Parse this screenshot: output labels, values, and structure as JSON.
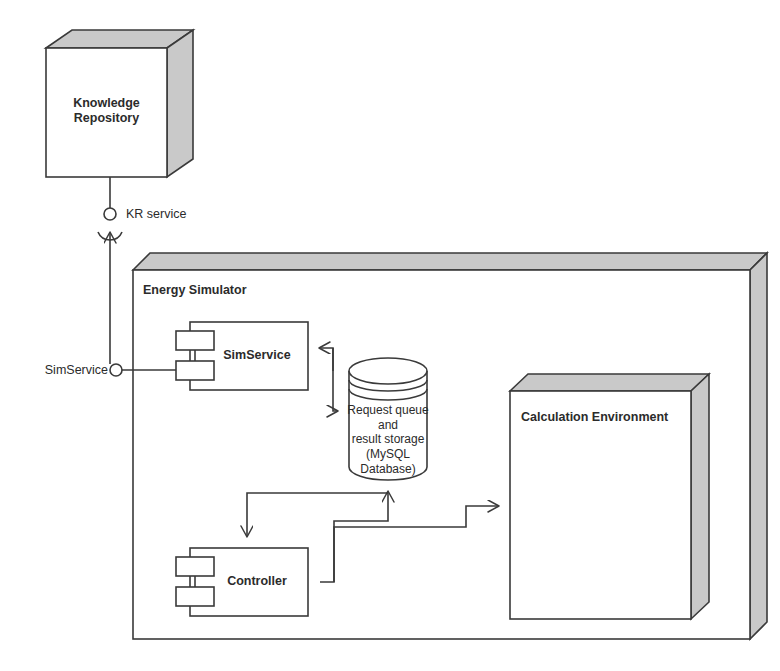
{
  "diagram": {
    "type": "uml-component-deployment-diagram",
    "palette": {
      "line": "#3a3a3a",
      "face": "#ffffff",
      "shade": "#c9c9c9",
      "shade_dark": "#bdbdbd",
      "text": "#2b2b2b",
      "background": "#ffffff"
    }
  },
  "nodes": {
    "knowledge_repository": {
      "label": "Knowledge\nRepository",
      "shape": "3d-box",
      "bold": true
    },
    "energy_simulator": {
      "label": "Energy Simulator",
      "shape": "3d-box-container",
      "bold": true
    },
    "sim_service": {
      "label": "SimService",
      "shape": "uml-component",
      "bold": true
    },
    "controller": {
      "label": "Controller",
      "shape": "uml-component",
      "bold": true
    },
    "database": {
      "label": "Request queue and\nresult storage\n(MySQL Database)",
      "shape": "cylinder",
      "bold": false
    },
    "calculation_environment": {
      "label": "Calculation Environment",
      "shape": "3d-box",
      "bold": true
    }
  },
  "interfaces": {
    "kr_service": {
      "label": "KR service",
      "kind": "ball-and-socket",
      "provider": "knowledge_repository",
      "consumer": "sim_service"
    },
    "sim_service_port": {
      "label": "SimService",
      "kind": "ball",
      "provider": "energy_simulator"
    }
  },
  "connections": [
    {
      "name": "db-to-simservice",
      "from": "database",
      "to": "sim_service",
      "arrow": "open"
    },
    {
      "name": "simservice-to-db",
      "from": "sim_service",
      "to": "database",
      "arrow": "open"
    },
    {
      "name": "db-to-controller",
      "from": "database",
      "to": "controller",
      "arrow": "open"
    },
    {
      "name": "controller-to-db",
      "from": "controller",
      "to": "database",
      "arrow": "open"
    },
    {
      "name": "controller-to-calculation-environment",
      "from": "controller",
      "to": "calculation_environment",
      "arrow": "open"
    },
    {
      "name": "simservice-port-link",
      "from": "sim_service_port",
      "to": "sim_service",
      "arrow": "none"
    },
    {
      "name": "simservice-to-kr-service",
      "from": "sim_service_port",
      "to": "kr_service",
      "arrow": "open"
    },
    {
      "name": "kr-service-to-knowledge-repository",
      "from": "kr_service",
      "to": "knowledge_repository",
      "arrow": "none"
    }
  ]
}
